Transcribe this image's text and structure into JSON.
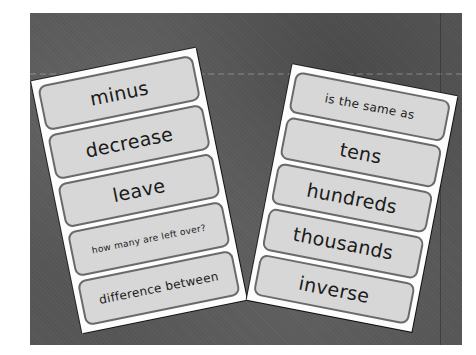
{
  "scene": {
    "description": "Two laminated word cards on a dark grey fabric background",
    "background_color": "#555555",
    "card_color": "#fdfdfd",
    "word_box_color": "#d7d7d7",
    "word_box_border": "#6a6a6a"
  },
  "left_card": {
    "words": [
      {
        "text": "minus"
      },
      {
        "text": "decrease"
      },
      {
        "text": "leave"
      },
      {
        "text": "how many are left over?"
      },
      {
        "text": "difference between"
      }
    ]
  },
  "right_card": {
    "words": [
      {
        "text": "is the same as"
      },
      {
        "text": "tens"
      },
      {
        "text": "hundreds"
      },
      {
        "text": "thousands"
      },
      {
        "text": "inverse"
      }
    ]
  }
}
